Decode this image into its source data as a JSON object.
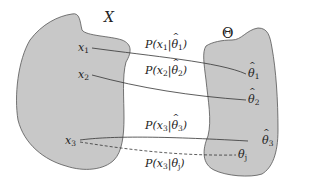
{
  "diagram": {
    "set_x": {
      "label": "X",
      "fill": "#c8c8c8",
      "stroke": "#555555"
    },
    "set_theta": {
      "label": "Θ",
      "fill": "#c8c8c8",
      "stroke": "#555555"
    },
    "points_x": [
      {
        "name": "x",
        "sub": "1"
      },
      {
        "name": "x",
        "sub": "2"
      },
      {
        "name": "x",
        "sub": "3"
      }
    ],
    "points_theta": [
      {
        "name": "θ",
        "sub": "1",
        "hat": true
      },
      {
        "name": "θ",
        "sub": "2",
        "hat": true
      },
      {
        "name": "θ",
        "sub": "3",
        "hat": true
      },
      {
        "name": "θ",
        "sub": "j",
        "hat": false
      }
    ],
    "edges": [
      {
        "label": "P(x",
        "xsub": "1",
        "mid": "|",
        "theta": "θ",
        "tsub": "1",
        "hat": true,
        "style": "solid"
      },
      {
        "label": "P(x",
        "xsub": "2",
        "mid": "|",
        "theta": "θ",
        "tsub": "2",
        "hat": true,
        "style": "solid"
      },
      {
        "label": "P(x",
        "xsub": "3",
        "mid": "|",
        "theta": "θ",
        "tsub": "3",
        "hat": true,
        "style": "solid"
      },
      {
        "label": "P(x",
        "xsub": "3",
        "mid": "|",
        "theta": "θ",
        "tsub": "j",
        "hat": false,
        "style": "dashed"
      }
    ],
    "close_paren": ")"
  }
}
